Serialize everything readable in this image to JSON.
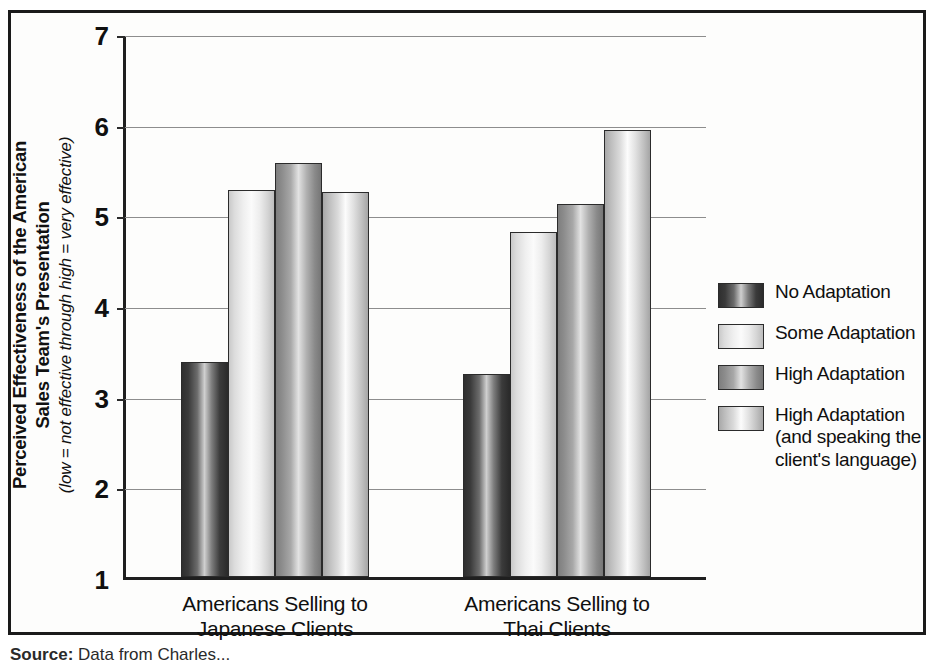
{
  "chart_data": {
    "type": "bar",
    "title": "",
    "subtitle": "",
    "xlabel": "",
    "ylabel": "Perceived Effectiveness of the American Sales Team's Presentation (low = not effective through high = very effective)",
    "ylabel_lines": {
      "bold_line_1": "Perceived Effectiveness of the American",
      "bold_line_2": "Sales Team's Presentation",
      "italic_line": "(low = not effective through high = very effective)"
    },
    "categories": [
      "Americans Selling to Japanese Clients",
      "Americans Selling to Thai Clients"
    ],
    "category_lines": [
      [
        "Americans Selling to",
        "Japanese Clients"
      ],
      [
        "Americans Selling to",
        "Thai Clients"
      ]
    ],
    "series": [
      {
        "name": "No Adaptation",
        "values": [
          3.37,
          3.24
        ],
        "color": "#3a3a3a"
      },
      {
        "name": "Some Adaptation",
        "values": [
          5.27,
          4.81
        ],
        "color": "#f0f0f0"
      },
      {
        "name": "High Adaptation",
        "values": [
          5.57,
          5.11
        ],
        "color": "#909090"
      },
      {
        "name": "High Adaptation (and speaking the client's language)",
        "values": [
          5.25,
          5.93
        ],
        "color": "#cccccc"
      }
    ],
    "ylim": [
      1,
      7
    ],
    "yticks": [
      1,
      2,
      3,
      4,
      5,
      6,
      7
    ],
    "ytick_labels": [
      "1",
      "2",
      "3",
      "4",
      "5",
      "6",
      "7"
    ],
    "grid": true,
    "grid_axis": "y",
    "legend_position": "right"
  },
  "legend": {
    "items": [
      {
        "label_lines": [
          "No Adaptation"
        ]
      },
      {
        "label_lines": [
          "Some Adaptation"
        ]
      },
      {
        "label_lines": [
          "High Adaptation"
        ]
      },
      {
        "label_lines": [
          "High Adaptation",
          "(and speaking the",
          "client's language)"
        ]
      }
    ]
  },
  "caption": {
    "source_label": "Source:",
    "source_text": "Data from Charles..."
  }
}
